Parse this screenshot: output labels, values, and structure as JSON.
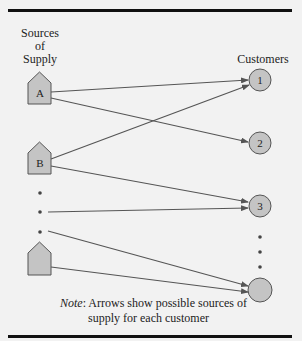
{
  "figure": {
    "sources_label": [
      "Sources",
      "of",
      "Supply"
    ],
    "customers_label": "Customers",
    "sources": [
      {
        "id": "A",
        "label": "A"
      },
      {
        "id": "B",
        "label": "B"
      },
      {
        "id": "last",
        "label": ""
      }
    ],
    "customers": [
      {
        "id": "1",
        "label": "1"
      },
      {
        "id": "2",
        "label": "2"
      },
      {
        "id": "3",
        "label": "3"
      },
      {
        "id": "last",
        "label": ""
      }
    ],
    "arrows": [
      {
        "from": "A",
        "to": "1"
      },
      {
        "from": "A",
        "to": "2"
      },
      {
        "from": "B",
        "to": "1"
      },
      {
        "from": "B",
        "to": "3"
      },
      {
        "from": "...",
        "to": "3"
      },
      {
        "from": "...",
        "to": "last"
      },
      {
        "from": "last",
        "to": "last"
      }
    ],
    "note_label": "Note",
    "note_text_line1": ":  Arrows show possible sources of",
    "note_text_line2": "supply for each customer",
    "colors": {
      "node_fill": "#c4c4c4",
      "node_stroke": "#555555",
      "arrow": "#555555",
      "rule": "#111111",
      "background": "#f2f2f2"
    }
  }
}
